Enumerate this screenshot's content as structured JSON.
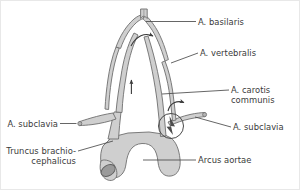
{
  "figure": {
    "background_color": "#ffffff",
    "vessel_fill_color": "#cfcfcf",
    "vessel_outline_color": "#6e6e6e",
    "lumen_color": "#8d8d8d",
    "leader_line_color": "#4a4a4a",
    "label_text_color": "#3a3a3a"
  },
  "labels": {
    "basilaris": "A. basilaris",
    "vertebralis": "A. vertebralis",
    "carotis_communis_line1": "A. carotis",
    "carotis_communis_line2": "communis",
    "subclavia_right": "A. subclavia",
    "subclavia_left": "A. subclavia",
    "truncus_line1": "Truncus brachio-",
    "truncus_line2": "cephalicus",
    "arcus_aortae": "Arcus aortae"
  },
  "markers": {
    "apex_flow_arrow": "curved-arrow-right",
    "left_vertebral_flow_arrow": "arrow-up",
    "right_subclavian_flow_arrow": "curved-arrow-down-right",
    "stenosis_circle": "circle-highlight",
    "stenosis_symbol": "dark-wedge"
  }
}
